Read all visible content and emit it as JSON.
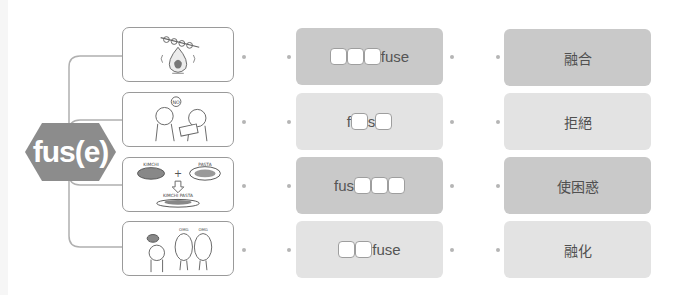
{
  "root": {
    "label": "fus(e)",
    "shape": "hexagon",
    "color": "#8c8c8c"
  },
  "connector_color": "#b0b0b0",
  "rows": [
    {
      "picture": {
        "icon": "burning-skewer-illustration",
        "caption": ""
      },
      "pattern": {
        "segments": [
          {
            "type": "blank"
          },
          {
            "type": "blank"
          },
          {
            "type": "blank"
          },
          {
            "type": "text",
            "value": "fuse"
          }
        ]
      },
      "pattern_bg": "dark",
      "meaning": "融合",
      "meaning_bg": "dark"
    },
    {
      "picture": {
        "icon": "refusal-illustration",
        "caption": "NO"
      },
      "pattern": {
        "segments": [
          {
            "type": "text",
            "value": "f"
          },
          {
            "type": "blank"
          },
          {
            "type": "text",
            "value": "s"
          },
          {
            "type": "blank"
          }
        ]
      },
      "pattern_bg": "light",
      "meaning": "拒絕",
      "meaning_bg": "light"
    },
    {
      "picture": {
        "icon": "kimchi-pasta-illustration",
        "labels": [
          "KIMCHI",
          "PASTA",
          "KIMCHI PASTA"
        ]
      },
      "pattern": {
        "segments": [
          {
            "type": "text",
            "value": "fus"
          },
          {
            "type": "blank"
          },
          {
            "type": "blank"
          },
          {
            "type": "blank"
          }
        ]
      },
      "pattern_bg": "dark",
      "meaning": "使困惑",
      "meaning_bg": "dark"
    },
    {
      "picture": {
        "icon": "confused-twins-illustration",
        "labels": [
          "OMG",
          "OMG"
        ]
      },
      "pattern": {
        "segments": [
          {
            "type": "blank"
          },
          {
            "type": "blank"
          },
          {
            "type": "text",
            "value": "fuse"
          }
        ]
      },
      "pattern_bg": "light",
      "meaning": "融化",
      "meaning_bg": "light"
    }
  ],
  "colors": {
    "dark_card": "#c9c9c9",
    "light_card": "#e3e3e3",
    "text": "#555555"
  }
}
